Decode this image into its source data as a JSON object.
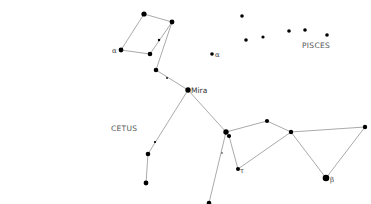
{
  "diagram": {
    "type": "star-chart",
    "labels": {
      "cetus": "CETUS",
      "pisces": "PISCES",
      "mira": "Mira",
      "alpha_cetus": "α",
      "alpha_pisces": "α",
      "beta": "β",
      "tau": "τ"
    },
    "colors": {
      "line": "#a0a0a0",
      "star": "#000000",
      "text": "#555555"
    },
    "stars": [
      {
        "id": "s1",
        "x": 144,
        "y": 14,
        "r": 2.6
      },
      {
        "id": "s2",
        "x": 172,
        "y": 22,
        "r": 2.4
      },
      {
        "id": "s3",
        "x": 159,
        "y": 40,
        "r": 1.2
      },
      {
        "id": "alpha-cetus",
        "x": 121,
        "y": 50,
        "r": 2.4
      },
      {
        "id": "s5",
        "x": 150,
        "y": 54,
        "r": 2.3
      },
      {
        "id": "s6",
        "x": 156,
        "y": 70,
        "r": 2.3
      },
      {
        "id": "s7",
        "x": 167,
        "y": 78,
        "r": 0.9
      },
      {
        "id": "mira",
        "x": 188,
        "y": 90,
        "r": 2.7
      },
      {
        "id": "alpha-pisces",
        "x": 212,
        "y": 54,
        "r": 1.8
      },
      {
        "id": "p1",
        "x": 242,
        "y": 16,
        "r": 1.8
      },
      {
        "id": "p2",
        "x": 246,
        "y": 40,
        "r": 1.8
      },
      {
        "id": "p3",
        "x": 263,
        "y": 37,
        "r": 1.6
      },
      {
        "id": "p4",
        "x": 289,
        "y": 31,
        "r": 1.8
      },
      {
        "id": "p5",
        "x": 305,
        "y": 30,
        "r": 1.8
      },
      {
        "id": "p6",
        "x": 327,
        "y": 35,
        "r": 1.8
      },
      {
        "id": "s9",
        "x": 155,
        "y": 142,
        "r": 1.1
      },
      {
        "id": "s10",
        "x": 148,
        "y": 154,
        "r": 2.3
      },
      {
        "id": "s11",
        "x": 146,
        "y": 183,
        "r": 2.4
      },
      {
        "id": "s12",
        "x": 226,
        "y": 132,
        "r": 2.7
      },
      {
        "id": "s13",
        "x": 229,
        "y": 136,
        "r": 2.1
      },
      {
        "id": "s14",
        "x": 222,
        "y": 153,
        "r": 0.7
      },
      {
        "id": "tau",
        "x": 238,
        "y": 169,
        "r": 2.0
      },
      {
        "id": "s16",
        "x": 209,
        "y": 203,
        "r": 2.3
      },
      {
        "id": "s17",
        "x": 267,
        "y": 121,
        "r": 2.1
      },
      {
        "id": "s18",
        "x": 291,
        "y": 132,
        "r": 2.2
      },
      {
        "id": "s19",
        "x": 365,
        "y": 127,
        "r": 2.2
      },
      {
        "id": "beta",
        "x": 326,
        "y": 178,
        "r": 3.3
      }
    ],
    "lines": [
      [
        144,
        14,
        172,
        22
      ],
      [
        144,
        14,
        121,
        50
      ],
      [
        121,
        50,
        150,
        54
      ],
      [
        150,
        54,
        172,
        22
      ],
      [
        172,
        22,
        156,
        70
      ],
      [
        156,
        70,
        188,
        90
      ],
      [
        188,
        90,
        148,
        154
      ],
      [
        148,
        154,
        146,
        183
      ],
      [
        188,
        90,
        226,
        132
      ],
      [
        226,
        132,
        209,
        203
      ],
      [
        229,
        136,
        238,
        169
      ],
      [
        238,
        169,
        291,
        132
      ],
      [
        226,
        132,
        267,
        121
      ],
      [
        267,
        121,
        291,
        132
      ],
      [
        291,
        132,
        365,
        127
      ],
      [
        291,
        132,
        326,
        178
      ],
      [
        365,
        127,
        326,
        178
      ]
    ]
  }
}
